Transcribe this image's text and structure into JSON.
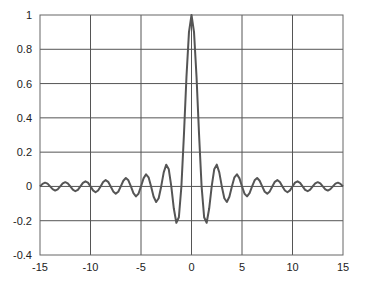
{
  "chart_data": {
    "type": "line",
    "title": "",
    "xlabel": "",
    "ylabel": "",
    "xlim": [
      -15,
      15
    ],
    "ylim": [
      -0.4,
      1
    ],
    "grid": true,
    "legend": null,
    "x_ticks": [
      -15,
      -10,
      -5,
      0,
      5,
      10,
      15
    ],
    "x_tick_labels": [
      "-15",
      "-10",
      "-5",
      "0",
      "5",
      "10",
      "15"
    ],
    "y_ticks": [
      -0.4,
      -0.2,
      0,
      0.2,
      0.4,
      0.6,
      0.8,
      1
    ],
    "y_tick_labels": [
      "-0.4",
      "-0.2",
      "0",
      "0.2",
      "0.4",
      "0.6",
      "0.8",
      "1"
    ],
    "series": [
      {
        "name": "sinc(x) = sin(πx)/(πx)",
        "color": "#555555",
        "x_start": -15,
        "x_step": 0.25,
        "values": [
          0,
          0.015,
          0.022,
          0.016,
          0,
          -0.016,
          -0.024,
          -0.017,
          0,
          0.018,
          0.025,
          0.018,
          0,
          -0.019,
          -0.028,
          -0.02,
          0,
          0.021,
          0.03,
          0.022,
          0,
          -0.023,
          -0.034,
          -0.024,
          0,
          0.026,
          0.037,
          0.027,
          0,
          -0.029,
          -0.042,
          -0.031,
          0,
          0.033,
          0.049,
          0.036,
          0,
          -0.039,
          -0.058,
          -0.043,
          0,
          0.047,
          0.071,
          0.053,
          0,
          -0.06,
          -0.091,
          -0.069,
          0,
          0.082,
          0.127,
          0.1,
          0,
          -0.129,
          -0.212,
          -0.18,
          0,
          0.3,
          0.637,
          0.9,
          1,
          0.9,
          0.637,
          0.3,
          0,
          -0.18,
          -0.212,
          -0.129,
          0,
          0.1,
          0.127,
          0.082,
          0,
          -0.069,
          -0.091,
          -0.06,
          0,
          0.053,
          0.071,
          0.047,
          0,
          -0.043,
          -0.058,
          -0.039,
          0,
          0.036,
          0.049,
          0.033,
          0,
          -0.031,
          -0.042,
          -0.029,
          0,
          0.027,
          0.037,
          0.026,
          0,
          -0.024,
          -0.034,
          -0.023,
          0,
          0.022,
          0.03,
          0.021,
          0,
          -0.02,
          -0.028,
          -0.019,
          0,
          0.018,
          0.025,
          0.018,
          0,
          -0.017,
          -0.024,
          -0.016,
          0,
          0.016,
          0.022,
          0.015,
          0
        ]
      }
    ]
  },
  "style": {
    "axis_color": "#666666",
    "grid_color": "#555555",
    "line_color": "#555555",
    "background": "#ffffff"
  }
}
